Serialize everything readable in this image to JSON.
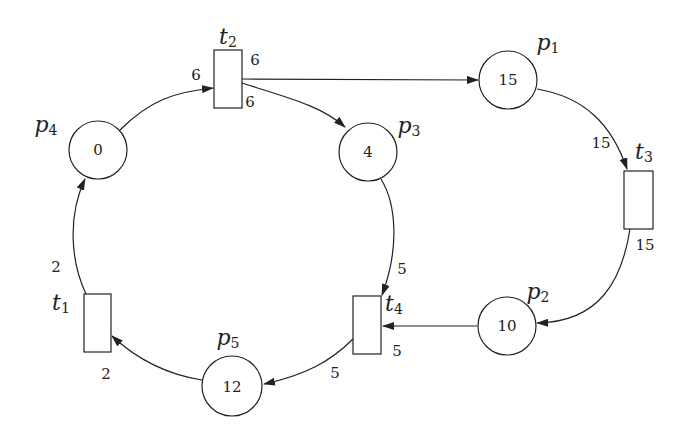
{
  "diagram": {
    "type": "petri-net",
    "places": [
      {
        "id": "p1",
        "name": "p",
        "sub": "1",
        "tokens": "15"
      },
      {
        "id": "p2",
        "name": "p",
        "sub": "2",
        "tokens": "10"
      },
      {
        "id": "p3",
        "name": "p",
        "sub": "3",
        "tokens": "4"
      },
      {
        "id": "p4",
        "name": "p",
        "sub": "4",
        "tokens": "0"
      },
      {
        "id": "p5",
        "name": "p",
        "sub": "5",
        "tokens": "12"
      }
    ],
    "transitions": [
      {
        "id": "t1",
        "name": "t",
        "sub": "1"
      },
      {
        "id": "t2",
        "name": "t",
        "sub": "2"
      },
      {
        "id": "t3",
        "name": "t",
        "sub": "3"
      },
      {
        "id": "t4",
        "name": "t",
        "sub": "4"
      }
    ],
    "arcs": [
      {
        "from": "p4",
        "to": "t2",
        "weight": "6"
      },
      {
        "from": "t2",
        "to": "p1",
        "weight": "6"
      },
      {
        "from": "t2",
        "to": "p3",
        "weight": "6"
      },
      {
        "from": "p1",
        "to": "t3",
        "weight": "15"
      },
      {
        "from": "t3",
        "to": "p2",
        "weight": "15"
      },
      {
        "from": "p3",
        "to": "t4",
        "weight": "5"
      },
      {
        "from": "p2",
        "to": "t4",
        "weight": "5"
      },
      {
        "from": "t4",
        "to": "p5",
        "weight": "5"
      },
      {
        "from": "p5",
        "to": "t1",
        "weight": "2"
      },
      {
        "from": "t1",
        "to": "p4",
        "weight": "2"
      }
    ]
  }
}
